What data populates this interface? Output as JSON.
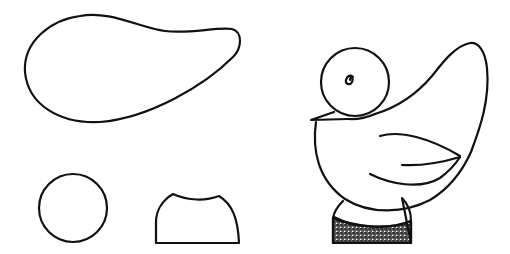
{
  "figure": {
    "colors": {
      "stroke": "#111111",
      "background": "#ffffff",
      "stipple": "#555555"
    },
    "pieces": [
      {
        "name": "body-wing-piece",
        "shape": "teardrop"
      },
      {
        "name": "head-piece",
        "shape": "circle"
      },
      {
        "name": "base-piece",
        "shape": "dome-stand"
      }
    ],
    "assembled": {
      "name": "assembled-bird",
      "parts": [
        "head",
        "eye",
        "beak",
        "body",
        "wing",
        "tail",
        "stand"
      ]
    }
  }
}
